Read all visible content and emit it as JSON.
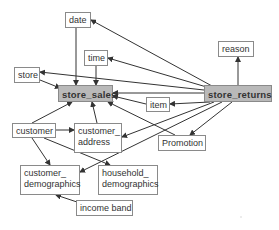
{
  "diagram": {
    "title": "",
    "nodes": {
      "date": {
        "label": "date",
        "type": "dimension"
      },
      "time": {
        "label": "time",
        "type": "dimension"
      },
      "store": {
        "label": "store",
        "type": "dimension"
      },
      "store_sales": {
        "label": "store_sales",
        "type": "fact"
      },
      "item": {
        "label": "item",
        "type": "dimension"
      },
      "store_returns": {
        "label": "store_returns",
        "type": "fact"
      },
      "reason": {
        "label": "reason",
        "type": "dimension"
      },
      "customer": {
        "label": "customer",
        "type": "dimension"
      },
      "customer_address": {
        "label": "customer_ address",
        "type": "dimension"
      },
      "promotion": {
        "label": "Promotion",
        "type": "dimension"
      },
      "customer_demographics": {
        "label": "customer_ demographics",
        "type": "dimension"
      },
      "household_demographics": {
        "label": "household_ demographics",
        "type": "dimension"
      },
      "income_band": {
        "label": "income band",
        "type": "dimension"
      }
    },
    "edges": [
      {
        "from": "date",
        "to": "store_sales"
      },
      {
        "from": "time",
        "to": "store_sales"
      },
      {
        "from": "store",
        "to": "store_sales"
      },
      {
        "from": "item",
        "to": "store_sales"
      },
      {
        "from": "customer",
        "to": "store_sales"
      },
      {
        "from": "customer_address",
        "to": "store_sales"
      },
      {
        "from": "promotion",
        "to": "store_sales"
      },
      {
        "from": "store_returns",
        "to": "date"
      },
      {
        "from": "store_returns",
        "to": "time"
      },
      {
        "from": "store_returns",
        "to": "store"
      },
      {
        "from": "store_returns",
        "to": "store_sales"
      },
      {
        "from": "store_returns",
        "to": "item"
      },
      {
        "from": "store_returns",
        "to": "reason"
      },
      {
        "from": "store_returns",
        "to": "customer_address"
      },
      {
        "from": "store_returns",
        "to": "customer_demographics"
      },
      {
        "from": "store_returns",
        "to": "promotion"
      },
      {
        "from": "customer",
        "to": "customer_address"
      },
      {
        "from": "customer",
        "to": "customer_demographics"
      },
      {
        "from": "customer",
        "to": "household_demographics"
      },
      {
        "from": "income_band",
        "to": "customer_demographics"
      }
    ],
    "colors": {
      "fact_fill": "#b9b9b9",
      "border": "#8a8a8a",
      "edge": "#333333",
      "background": "#ffffff"
    }
  }
}
